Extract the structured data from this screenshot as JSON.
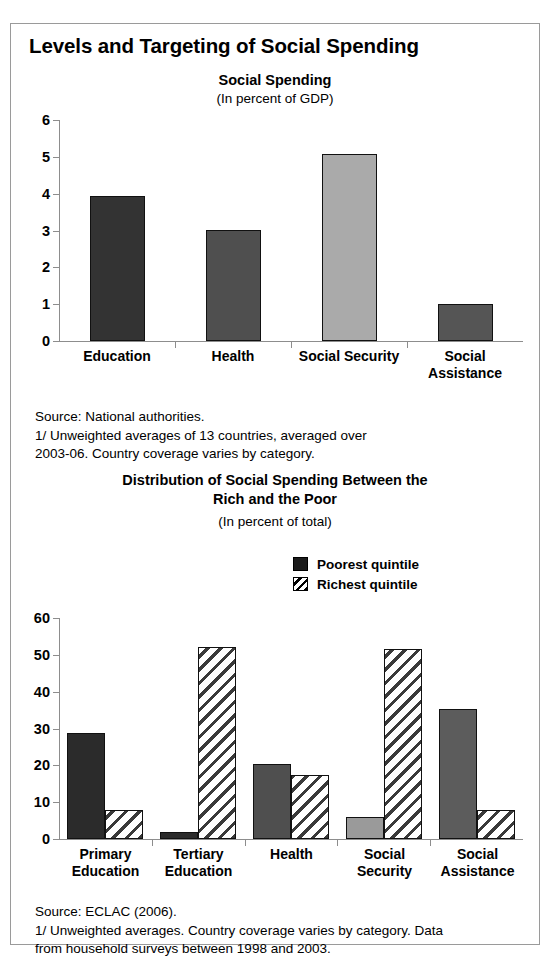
{
  "figure": {
    "title": "Levels and Targeting of Social Spending"
  },
  "chart_data": [
    {
      "id": "social-spending",
      "type": "bar",
      "title": "Social Spending",
      "subtitle": "(In percent of GDP)",
      "xlabel": "",
      "ylabel": "",
      "ylim": [
        0,
        6
      ],
      "yticks": [
        0,
        1,
        2,
        3,
        4,
        5,
        6
      ],
      "grid": false,
      "legend": null,
      "categories": [
        "Education",
        "Health",
        "Social Security",
        "Social Assistance"
      ],
      "values": [
        3.95,
        3.02,
        5.07,
        1.0
      ],
      "bar_colors": [
        "#333333",
        "#4f4f4f",
        "#aaaaaa",
        "#555555"
      ],
      "notes": "Source: National authorities.\n1/ Unweighted averages of 13 countries, averaged over\n2003-06. Country coverage varies by category."
    },
    {
      "id": "distribution-social-spending",
      "type": "bar",
      "title": "Distribution of Social Spending Between the\nRich and the Poor",
      "subtitle": "(In percent of total)",
      "xlabel": "",
      "ylabel": "",
      "ylim": [
        0,
        60
      ],
      "yticks": [
        0,
        10,
        20,
        30,
        40,
        50,
        60
      ],
      "grid": false,
      "legend_position": "top-right",
      "categories": [
        "Primary\nEducation",
        "Tertiary\nEducation",
        "Health",
        "Social\nSecurity",
        "Social\nAssistance"
      ],
      "series": [
        {
          "name": "Poorest quintile",
          "values": [
            28.8,
            1.8,
            20.5,
            6.0,
            35.4
          ],
          "style": "solid",
          "colors": [
            "#2b2b2b",
            "#2b2b2b",
            "#4f4f4f",
            "#9a9a9a",
            "#5c5c5c"
          ]
        },
        {
          "name": "Richest quintile",
          "values": [
            8.0,
            52.2,
            17.5,
            51.5,
            8.0
          ],
          "style": "hatched",
          "colors": [
            "#ffffff",
            "#ffffff",
            "#ffffff",
            "#ffffff",
            "#ffffff"
          ]
        }
      ],
      "notes": "Source: ECLAC (2006).\n1/ Unweighted averages. Country coverage varies by category. Data\nfrom household surveys between 1998 and 2003."
    }
  ]
}
